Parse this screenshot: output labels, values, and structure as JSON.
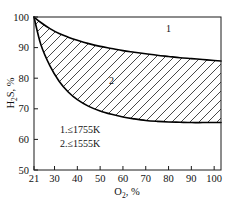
{
  "chart_data": {
    "type": "line",
    "title": "",
    "xlabel": "O2, %",
    "xlabel_main": "O",
    "xlabel_sub": "2",
    "xlabel_suffix": ", %",
    "ylabel": "H2S, %",
    "ylabel_main": "H",
    "ylabel_sub": "2",
    "ylabel_main2": "S, %",
    "xlim": [
      21,
      103
    ],
    "ylim": [
      50,
      100
    ],
    "xticks": [
      21,
      30,
      40,
      50,
      60,
      70,
      80,
      90,
      100
    ],
    "yticks": [
      50,
      60,
      70,
      80,
      90,
      100
    ],
    "xtick_labels": [
      "21",
      "30",
      "40",
      "50",
      "60",
      "70",
      "80",
      "90",
      "100"
    ],
    "ytick_labels": [
      "50",
      "60",
      "70",
      "80",
      "90",
      "100"
    ],
    "grid": false,
    "legend_position": "inside-lower-left",
    "shaded_region": "area between curve 1 (upper) and curve 2 (lower), diagonal hatching",
    "series": [
      {
        "name": "1",
        "label": "1",
        "annotation": "1.≤1755K",
        "temperature_K": 1755,
        "x": [
          21,
          24,
          28,
          32,
          36,
          40,
          45,
          50,
          55,
          60,
          65,
          70,
          75,
          80,
          85,
          90,
          95,
          100,
          103
        ],
        "y": [
          100,
          98.2,
          96.2,
          94.6,
          93.4,
          92.4,
          91.3,
          90.4,
          89.7,
          89.0,
          88.5,
          88.0,
          87.5,
          87.1,
          86.7,
          86.4,
          86.1,
          85.8,
          85.6
        ]
      },
      {
        "name": "2",
        "label": "2",
        "annotation": "2.≤1555K",
        "temperature_K": 1555,
        "x": [
          21,
          24,
          28,
          32,
          36,
          40,
          45,
          50,
          55,
          60,
          65,
          70,
          75,
          80,
          85,
          90,
          95,
          100,
          103
        ],
        "y": [
          100,
          91.0,
          84.0,
          79.0,
          75.5,
          73.0,
          70.8,
          69.3,
          68.2,
          67.3,
          66.7,
          66.2,
          65.9,
          65.7,
          65.6,
          65.5,
          65.5,
          65.5,
          65.5
        ]
      }
    ],
    "curve_labels": [
      {
        "text": "1",
        "x": 80,
        "y": 95
      },
      {
        "text": "2",
        "x": 55,
        "y": 78
      }
    ],
    "legend": [
      {
        "text": "1.≤1755K"
      },
      {
        "text": "2.≤1555K"
      }
    ],
    "colors": {
      "line": "#000000",
      "hatch": "#1a1a1a",
      "frame": "#1a1a1a",
      "background": "#ffffff",
      "text": "#111111"
    }
  }
}
